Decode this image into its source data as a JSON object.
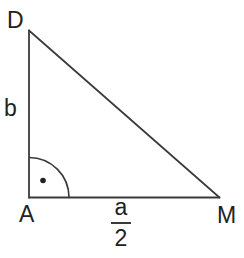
{
  "figure": {
    "kind": "right-triangle-diagram",
    "vertices": {
      "top_left": "D",
      "bottom_left": "A",
      "bottom_right": "M"
    },
    "side_labels": {
      "left_side": "b",
      "bottom_numerator": "a",
      "bottom_denominator": "2"
    },
    "right_angle_marker": "arc-with-dot",
    "colors": {
      "line": "#3a3a3a",
      "text": "#222222",
      "background": "#ffffff"
    }
  }
}
